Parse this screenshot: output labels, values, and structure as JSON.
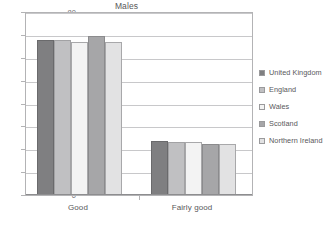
{
  "chart_data": {
    "type": "bar",
    "title": "Males",
    "xlabel": "",
    "ylabel": "",
    "categories": [
      "Good",
      "Fairly good"
    ],
    "ylim": [
      0,
      80
    ],
    "yticks": [
      0,
      10,
      20,
      30,
      40,
      50,
      60,
      70,
      80
    ],
    "grid": true,
    "legend_position": "right",
    "series": [
      {
        "name": "United Kingdom",
        "values": [
          67.5,
          23.0
        ],
        "color": "#7f7f81"
      },
      {
        "name": "England",
        "values": [
          67.3,
          22.8
        ],
        "color": "#c0c0c2"
      },
      {
        "name": "Wales",
        "values": [
          66.6,
          22.6
        ],
        "color": "#f3f3f3"
      },
      {
        "name": "Scotland",
        "values": [
          69.0,
          21.8
        ],
        "color": "#a6a6a8"
      },
      {
        "name": "Northern Ireland",
        "values": [
          66.5,
          21.7
        ],
        "color": "#e2e2e3"
      }
    ]
  }
}
